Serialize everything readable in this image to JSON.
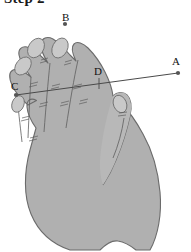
{
  "figure": {
    "caption": "Step 2",
    "caption_clipped": true,
    "background_color": "#ffffff",
    "width": 191,
    "height": 252,
    "colors": {
      "hand_fill": "#b0b0b0",
      "hand_outline": "#6b6b6b",
      "nail_fill": "#c9c9c9",
      "crease_line": "#5e5e5e",
      "measure_line": "#4a4a4a",
      "point_dot": "#555555",
      "label_text": "#111111",
      "caption_text": "#1a1a1a"
    },
    "points": [
      {
        "id": "A",
        "label": "A",
        "x": 178,
        "y": 73,
        "label_x": 172,
        "label_y": 56
      },
      {
        "id": "B",
        "label": "B",
        "x": 65,
        "y": 24,
        "label_x": 62,
        "label_y": 12
      },
      {
        "id": "C",
        "label": "C",
        "x": 16,
        "y": 95,
        "label_x": 11,
        "label_y": 81
      },
      {
        "id": "D",
        "label": "D",
        "x": 99,
        "y": 83,
        "label_x": 94,
        "label_y": 66
      }
    ],
    "measure_line": {
      "name": "line-C-to-A-through-D",
      "from": "C",
      "through": "D",
      "to": "A"
    },
    "tick_mark": {
      "at": "D",
      "orientation": "perpendicular"
    },
    "fingers": [
      "index-finger",
      "middle-finger",
      "ring-finger",
      "little-finger",
      "thumb"
    ]
  }
}
